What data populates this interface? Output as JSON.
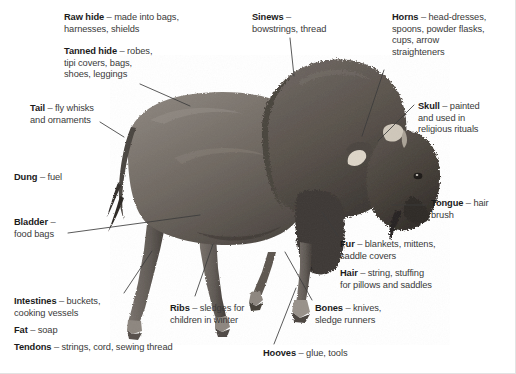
{
  "figure": {
    "title": "",
    "background_color": "#ffffff",
    "text_color": "#3a3a3a",
    "bold_color": "#1b1b1b",
    "line_color": "#3c3c3c",
    "border_color": "#e2e2e2"
  },
  "labels": [
    {
      "id": "raw-hide",
      "term": "Raw hide",
      "dash": " – ",
      "lines": [
        "made into bags,",
        "harnesses, shields"
      ],
      "x": 64,
      "y": 12
    },
    {
      "id": "tanned-hide",
      "term": "Tanned hide",
      "dash": " – ",
      "lines": [
        "robes,",
        "tipi covers, bags,",
        "shoes, leggings"
      ],
      "x": 64,
      "y": 46
    },
    {
      "id": "tail",
      "term": "Tail",
      "dash": " – ",
      "lines": [
        "fly whisks",
        "and ornaments"
      ],
      "x": 30,
      "y": 103
    },
    {
      "id": "dung",
      "term": "Dung",
      "dash": " – ",
      "lines": [
        "fuel"
      ],
      "x": 14,
      "y": 172
    },
    {
      "id": "bladder",
      "term": "Bladder",
      "dash": " – ",
      "lines": [
        "",
        "food bags"
      ],
      "x": 14,
      "y": 217
    },
    {
      "id": "intestines",
      "term": "Intestines",
      "dash": " – ",
      "lines": [
        "buckets,",
        "cooking vessels"
      ],
      "x": 14,
      "y": 296
    },
    {
      "id": "fat",
      "term": "Fat",
      "dash": " – ",
      "lines": [
        "soap"
      ],
      "x": 14,
      "y": 325
    },
    {
      "id": "tendons",
      "term": "Tendons",
      "dash": " – ",
      "lines": [
        "strings, cord, sewing thread"
      ],
      "x": 14,
      "y": 342
    },
    {
      "id": "sinews",
      "term": "Sinews",
      "dash": " – ",
      "lines": [
        "",
        "bowstrings, thread"
      ],
      "x": 252,
      "y": 12
    },
    {
      "id": "ribs",
      "term": "Ribs",
      "dash": " – ",
      "lines": [
        "sledges for",
        "children in winter"
      ],
      "x": 170,
      "y": 303
    },
    {
      "id": "hooves",
      "term": "Hooves",
      "dash": " – ",
      "lines": [
        "glue, tools"
      ],
      "x": 263,
      "y": 348
    },
    {
      "id": "horns",
      "term": "Horns",
      "dash": " – ",
      "lines": [
        "head-dresses,",
        "spoons, powder flasks,",
        "cups, arrow",
        "straighteners"
      ],
      "x": 392,
      "y": 12
    },
    {
      "id": "skull",
      "term": "Skull",
      "dash": " – ",
      "lines": [
        "painted",
        "and used in",
        "religious rituals"
      ],
      "x": 418,
      "y": 101
    },
    {
      "id": "tongue",
      "term": "Tongue",
      "dash": " – ",
      "lines": [
        "hair",
        "brush"
      ],
      "x": 431,
      "y": 198
    },
    {
      "id": "fur",
      "term": "Fur",
      "dash": " – ",
      "lines": [
        "blankets, mittens,",
        "saddle covers"
      ],
      "x": 340,
      "y": 239
    },
    {
      "id": "hair",
      "term": "Hair",
      "dash": " – ",
      "lines": [
        "string, stuffing",
        "for pillows and saddles"
      ],
      "x": 340,
      "y": 268
    },
    {
      "id": "bones",
      "term": "Bones",
      "dash": " – ",
      "lines": [
        "knives,",
        "sledge runners"
      ],
      "x": 315,
      "y": 303
    }
  ],
  "leader_lines": [
    {
      "id": "leader-tanned-hide",
      "x1": 140,
      "y1": 84,
      "x2": 190,
      "y2": 106
    },
    {
      "id": "leader-tail",
      "x1": 100,
      "y1": 122,
      "x2": 124,
      "y2": 137
    },
    {
      "id": "leader-bladder",
      "x1": 68,
      "y1": 233,
      "x2": 200,
      "y2": 215
    },
    {
      "id": "leader-intestines",
      "x1": 124,
      "y1": 293,
      "x2": 152,
      "y2": 251
    },
    {
      "id": "leader-sinews",
      "x1": 290,
      "y1": 38,
      "x2": 294,
      "y2": 76
    },
    {
      "id": "leader-ribs",
      "x1": 195,
      "y1": 296,
      "x2": 213,
      "y2": 244
    },
    {
      "id": "leader-hooves",
      "x1": 274,
      "y1": 344,
      "x2": 296,
      "y2": 288
    },
    {
      "id": "leader-horns",
      "x1": 384,
      "y1": 70,
      "x2": 362,
      "y2": 136
    },
    {
      "id": "leader-skull",
      "x1": 414,
      "y1": 105,
      "x2": 378,
      "y2": 141
    },
    {
      "id": "leader-tongue",
      "x1": 392,
      "y1": 205,
      "x2": 426,
      "y2": 205
    },
    {
      "id": "leader-fur",
      "x1": 338,
      "y1": 236,
      "x2": 322,
      "y2": 212
    },
    {
      "id": "leader-bones",
      "x1": 312,
      "y1": 300,
      "x2": 285,
      "y2": 252
    }
  ]
}
